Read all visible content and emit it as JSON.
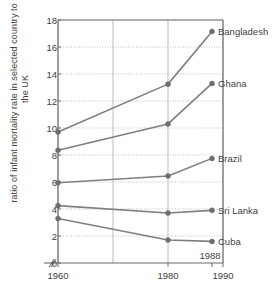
{
  "chart_data": {
    "type": "line",
    "title": "",
    "subtitle": "",
    "xlabel": "",
    "ylabel": "ratio of infant mortality rate in selected country to that in the UK",
    "x": [
      1960,
      1980,
      1988
    ],
    "xtick_labels": [
      "1960",
      "1980",
      "1990"
    ],
    "xtick_values": [
      1960,
      1980,
      1990
    ],
    "xlim": [
      1960,
      1990
    ],
    "ylim": [
      0,
      18
    ],
    "ytick_labels": [
      "0",
      "2",
      "4",
      "6",
      "8",
      "10",
      "12",
      "14",
      "16",
      "18"
    ],
    "ytick_values": [
      0,
      2,
      4,
      6,
      8,
      10,
      12,
      14,
      16,
      18
    ],
    "grid": {
      "horizontal": "dotted",
      "vertical": "solid",
      "vertical_values": [
        1960,
        1970,
        1980,
        1990
      ]
    },
    "legend_position": "right-inline-labels",
    "axis_break": {
      "axis": "x",
      "symbol": "//",
      "between": [
        "0",
        "1960"
      ]
    },
    "annotations": [
      {
        "text": "1988",
        "x": 1988,
        "y": 0.55
      }
    ],
    "series": [
      {
        "name": "Bangladesh",
        "values": [
          9.7,
          13.25,
          17.15
        ],
        "color": "#7f7f7f"
      },
      {
        "name": "Ghana",
        "values": [
          8.35,
          10.3,
          13.3
        ],
        "color": "#7f7f7f"
      },
      {
        "name": "Brazil",
        "values": [
          5.95,
          6.45,
          7.75
        ],
        "color": "#7f7f7f"
      },
      {
        "name": "Sri Lanka",
        "values": [
          4.25,
          3.7,
          3.9
        ],
        "color": "#7f7f7f"
      },
      {
        "name": "Cuba",
        "values": [
          3.3,
          1.7,
          1.6
        ],
        "color": "#7f7f7f"
      }
    ]
  },
  "style": {
    "line_color": "#7f7f7f",
    "marker_color": "#6e6e6e",
    "axis_color": "#6b6b6b",
    "grid_color": "#b4b4b4",
    "text_color": "#3f3f3f",
    "background": "#ffffff"
  }
}
